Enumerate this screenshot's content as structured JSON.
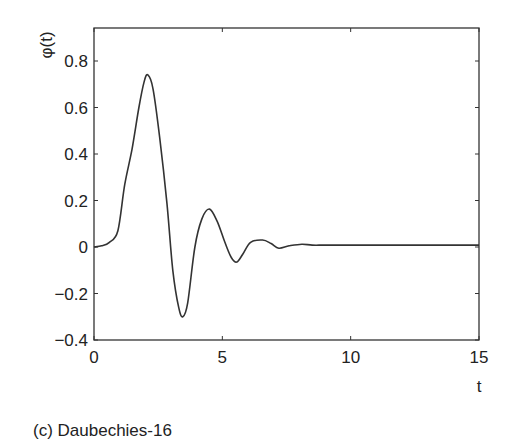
{
  "chart_data": {
    "type": "line",
    "title": "",
    "caption": "(c) Daubechies-16",
    "xlabel": "t",
    "ylabel": "φ(t)",
    "xlim": [
      0,
      15
    ],
    "ylim": [
      -0.4,
      0.94
    ],
    "xticks": [
      0,
      5,
      10,
      15
    ],
    "xtick_labels": [
      "0",
      "5",
      "10",
      "15"
    ],
    "yticks": [
      -0.4,
      -0.2,
      0,
      0.2,
      0.4,
      0.6,
      0.8
    ],
    "ytick_labels": [
      "−0.4",
      "−0.2",
      "0",
      "0.2",
      "0.4",
      "0.6",
      "0.8"
    ],
    "grid": false,
    "legend": null,
    "line_color": "#333333",
    "series": [
      {
        "name": "φ(t)",
        "x": [
          0,
          0.3,
          0.6,
          0.93,
          1.2,
          1.48,
          1.75,
          1.95,
          2.1,
          2.3,
          2.56,
          2.84,
          3.07,
          3.3,
          3.46,
          3.65,
          3.93,
          4.2,
          4.5,
          4.8,
          5.1,
          5.35,
          5.56,
          5.8,
          6.1,
          6.57,
          6.9,
          7.2,
          7.6,
          8.1,
          8.5,
          9.0,
          10,
          11,
          12,
          13,
          14,
          15
        ],
        "y": [
          0,
          0.005,
          0.02,
          0.07,
          0.27,
          0.42,
          0.6,
          0.71,
          0.74,
          0.68,
          0.47,
          0.19,
          -0.1,
          -0.26,
          -0.3,
          -0.24,
          0.0,
          0.12,
          0.163,
          0.11,
          0.02,
          -0.045,
          -0.065,
          -0.03,
          0.02,
          0.03,
          0.015,
          -0.005,
          0.005,
          0.012,
          0.008,
          0.008,
          0.008,
          0.008,
          0.008,
          0.008,
          0.008,
          0.008
        ]
      }
    ]
  },
  "caption": "(c) Daubechies-16"
}
